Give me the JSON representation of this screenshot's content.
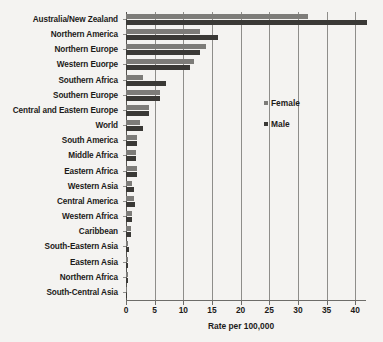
{
  "chart_data": {
    "type": "bar",
    "orientation": "horizontal",
    "title": "",
    "xlabel": "Rate per 100,000",
    "ylabel": "",
    "xlim": [
      0,
      42
    ],
    "xticks": [
      0,
      5,
      10,
      15,
      20,
      25,
      30,
      35,
      40
    ],
    "xtick_labels": [
      "0",
      "5",
      "10",
      "15",
      "20",
      "25",
      "30",
      "35",
      "40"
    ],
    "grid": true,
    "grid_axis": "x",
    "legend_position": "center-right",
    "categories": [
      "Australia/New Zealand",
      "Northern America",
      "Northern Europe",
      "Western Euorpe",
      "Southern Africa",
      "Southern Europe",
      "Central and Eastern Europe",
      "World",
      "South America",
      "Middle Africa",
      "Eastern Africa",
      "Western Asia",
      "Central America",
      "Western Africa",
      "Caribbean",
      "South-Eastern Asia",
      "Eastern Asia",
      "Northern Africa",
      "South-Central Asia"
    ],
    "series": [
      {
        "name": "Female",
        "color": "#7d7c79",
        "values": [
          31.8,
          12.9,
          13.9,
          11.8,
          3.0,
          6.0,
          4.0,
          2.4,
          1.9,
          1.7,
          1.9,
          1.0,
          1.4,
          1.0,
          0.8,
          0.4,
          0.3,
          0.3,
          0.1
        ]
      },
      {
        "name": "Male",
        "color": "#3a3936",
        "values": [
          42.0,
          16.0,
          12.9,
          11.2,
          7.0,
          6.0,
          4.1,
          3.0,
          2.0,
          1.8,
          2.0,
          1.4,
          1.5,
          1.1,
          0.9,
          0.5,
          0.4,
          0.4,
          0.1
        ]
      }
    ]
  },
  "legend": {
    "items": [
      {
        "label": "Female",
        "color": "#7d7c79"
      },
      {
        "label": "Male",
        "color": "#3a3936"
      }
    ]
  }
}
